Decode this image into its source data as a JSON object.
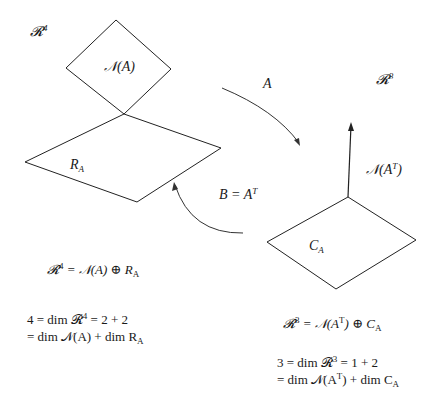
{
  "diagram": {
    "left_space": {
      "label": "𝓡",
      "exponent": "4",
      "nullspace_label": "𝒩(A)",
      "rowspace_label": "R",
      "rowspace_sub": "A"
    },
    "right_space": {
      "label": "𝓡",
      "exponent": "3",
      "left_nullspace_label": "𝒩(A",
      "left_nullspace_sup": "T",
      "left_nullspace_close": ")",
      "colspace_label": "C",
      "colspace_sub": "A"
    },
    "arrows": {
      "forward_label": "A",
      "backward_label": "B = A",
      "backward_sup": "T"
    },
    "equations": {
      "left_decomp": {
        "lhs": "𝓡",
        "lhs_exp": "4",
        "rhs": " = 𝒩(A) ⊕ R",
        "rhs_sub": "A"
      },
      "left_dim_line1": {
        "a": "4 = dim 𝓡",
        "a_exp": "4",
        "b": " = 2 + 2"
      },
      "left_dim_line2": {
        "a": "= dim 𝒩(A) + dim R",
        "a_sub": "A"
      },
      "right_decomp": {
        "lhs": "𝓡",
        "lhs_exp": "3",
        "mid": " = 𝒩(A",
        "mid_sup": "T",
        "rest": ") ⊕ C",
        "rest_sub": "A"
      },
      "right_dim_line1": {
        "a": "3 = dim 𝓡",
        "a_exp": "3",
        "b": " = 1 + 2"
      },
      "right_dim_line2": {
        "a": "= dim 𝒩(A",
        "a_sup": "T",
        "b": ") + dim C",
        "b_sub": "A"
      }
    }
  }
}
